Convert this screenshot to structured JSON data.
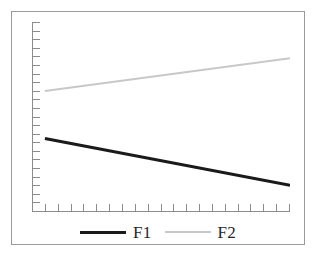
{
  "figure": {
    "background_color": "#ffffff",
    "frame_color": "#9a9a9a",
    "axis_color": "#8c8c8c"
  },
  "legend": {
    "position": "bottom-center",
    "entries": [
      {
        "label": "F1",
        "color": "#1a1a1a",
        "swatch": "thick-line"
      },
      {
        "label": "F2",
        "color": "#c8c8c8",
        "swatch": "thin-line"
      }
    ]
  },
  "chart_data": {
    "type": "line",
    "title": "",
    "subtitle": "",
    "xlabel": "",
    "ylabel": "",
    "grid": false,
    "legend_position": "bottom-center",
    "x_axis": {
      "tick_count": 21,
      "tick_labels": [],
      "range": [
        0,
        20
      ],
      "direction": "increasing"
    },
    "y_axis": {
      "tick_count": 23,
      "tick_labels": [],
      "range": [
        0,
        22
      ],
      "direction": "increasing"
    },
    "x": [
      1,
      20
    ],
    "series": [
      {
        "name": "F1",
        "color": "#1a1a1a",
        "line_width": 3,
        "trend": "decreasing",
        "values": [
          8.5,
          3.1
        ]
      },
      {
        "name": "F2",
        "color": "#c8c8c8",
        "line_width": 2,
        "trend": "increasing",
        "values": [
          14.0,
          17.8
        ]
      }
    ]
  }
}
